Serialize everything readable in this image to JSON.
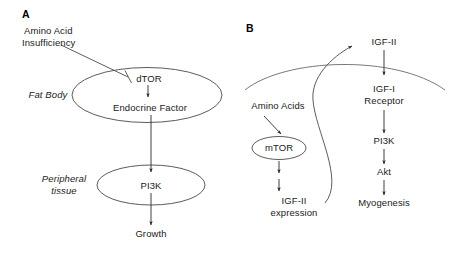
{
  "figure": {
    "background_color": "#ffffff",
    "line_color": "#3d3d3d",
    "text_color": "#1a1a1a"
  },
  "panels": [
    {
      "id": "A",
      "letter": "A",
      "nodes": {
        "amino_acid_insufficiency_line1": "Amino Acid",
        "amino_acid_insufficiency_line2": "Insufficiency",
        "fat_body": "Fat Body",
        "dtor": "dTOR",
        "endocrine_factor": "Endocrine Factor",
        "peripheral_tissue_line1": "Peripheral",
        "peripheral_tissue_line2": "tissue",
        "pi3k": "PI3K",
        "growth": "Growth"
      },
      "edges": [
        {
          "from": "Amino Acid Insufficiency",
          "to": "dTOR",
          "type": "inhibition"
        },
        {
          "from": "dTOR",
          "to": "Endocrine Factor",
          "type": "activation"
        },
        {
          "from": "Endocrine Factor",
          "to": "PI3K",
          "type": "activation"
        },
        {
          "from": "PI3K",
          "to": "Growth",
          "type": "activation"
        }
      ],
      "compartments": [
        {
          "label": "Fat Body",
          "shape": "ellipse",
          "contains": [
            "dTOR",
            "Endocrine Factor"
          ]
        },
        {
          "label": "Peripheral tissue",
          "shape": "ellipse",
          "contains": [
            "PI3K"
          ]
        }
      ]
    },
    {
      "id": "B",
      "letter": "B",
      "nodes": {
        "igf_ii": "IGF-II",
        "igf_i_receptor_line1": "IGF-I",
        "igf_i_receptor_line2": "Receptor",
        "pi3k": "PI3K",
        "akt": "Akt",
        "myogenesis": "Myogenesis",
        "amino_acids": "Amino Acids",
        "mtor": "mTOR",
        "igf_ii_expression_line1": "IGF-II",
        "igf_ii_expression_line2": "expression"
      },
      "edges": [
        {
          "from": "Amino Acids",
          "to": "mTOR",
          "type": "activation"
        },
        {
          "from": "mTOR",
          "to": "IGF-II expression",
          "type": "activation-two-step"
        },
        {
          "from": "IGF-II expression",
          "to": "IGF-II",
          "type": "curved-secretion"
        },
        {
          "from": "IGF-II",
          "to": "IGF-I Receptor",
          "type": "activation"
        },
        {
          "from": "IGF-I Receptor",
          "to": "PI3K",
          "type": "activation"
        },
        {
          "from": "PI3K",
          "to": "Akt",
          "type": "activation"
        },
        {
          "from": "Akt",
          "to": "Myogenesis",
          "type": "activation"
        }
      ],
      "compartments": [
        {
          "label": "",
          "shape": "membrane-arc",
          "note": "cell membrane"
        },
        {
          "label": "mTOR",
          "shape": "ellipse",
          "contains": [
            "mTOR"
          ]
        }
      ]
    }
  ]
}
